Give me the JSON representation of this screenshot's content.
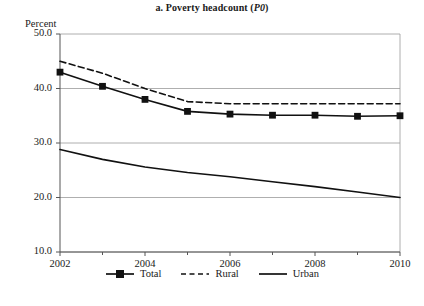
{
  "figure": {
    "title_prefix": "a. Poverty headcount (",
    "title_italic": "P0",
    "title_suffix": ")",
    "title_full": "a. Poverty headcount (P0)",
    "ylabel": "Percent"
  },
  "chart_data": {
    "type": "line",
    "title": "a. Poverty headcount (P0)",
    "xlabel": "",
    "ylabel": "Percent",
    "ylim": [
      10.0,
      50.0
    ],
    "xlim": [
      2002,
      2010
    ],
    "grid": "horizontal",
    "legend_position": "bottom",
    "y_ticks": [
      50.0,
      40.0,
      30.0,
      20.0,
      10.0
    ],
    "y_tick_labels": [
      "50.0",
      "40.0",
      "30.0",
      "20.0",
      "10.0"
    ],
    "x_ticks": [
      2002,
      2004,
      2006,
      2008,
      2010
    ],
    "x_tick_labels": [
      "2002",
      "2004",
      "2006",
      "2008",
      "2010"
    ],
    "x_minor_ticks": [
      2003,
      2005,
      2007,
      2009
    ],
    "x": [
      2002,
      2003,
      2004,
      2005,
      2006,
      2007,
      2008,
      2009,
      2010
    ],
    "series": [
      {
        "name": "Total",
        "style": "solid-marker",
        "marker": "square",
        "color": "#111111",
        "values": [
          43.0,
          40.4,
          38.0,
          35.8,
          35.3,
          35.1,
          35.1,
          34.9,
          35.0
        ]
      },
      {
        "name": "Rural",
        "style": "dashed",
        "marker": "none",
        "color": "#111111",
        "values": [
          45.0,
          42.8,
          40.0,
          37.6,
          37.2,
          37.2,
          37.2,
          37.2,
          37.2
        ]
      },
      {
        "name": "Urban",
        "style": "solid",
        "marker": "none",
        "color": "#111111",
        "values": [
          28.8,
          27.0,
          25.6,
          24.6,
          23.8,
          22.9,
          22.0,
          21.0,
          20.0
        ]
      }
    ]
  },
  "legend": {
    "items": [
      {
        "label": "Total",
        "style": "solid-marker"
      },
      {
        "label": "Rural",
        "style": "dashed"
      },
      {
        "label": "Urban",
        "style": "solid"
      }
    ]
  }
}
